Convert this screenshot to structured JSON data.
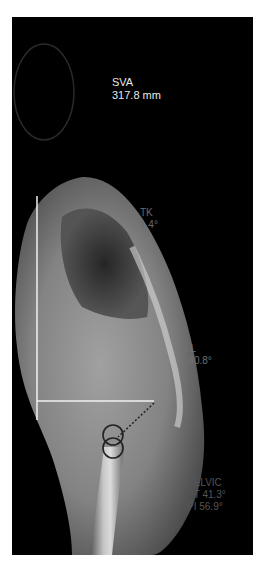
{
  "image": {
    "description": "Lateral full-spine radiograph with sagittal alignment measurements",
    "background": "#000000"
  },
  "measurements": {
    "sva": {
      "label": "SVA",
      "value": "317.8 mm"
    },
    "tk": {
      "label": "TK",
      "value": "1.4°"
    },
    "ll": {
      "label": "LL",
      "value": "-40.8°"
    },
    "pelvic": {
      "label": "PELVIC",
      "pt": "PT 41.3°",
      "pi": "PI 56.9°"
    }
  },
  "overlay": {
    "line_color": "#f0f0f0",
    "circle_color": "#222222"
  }
}
